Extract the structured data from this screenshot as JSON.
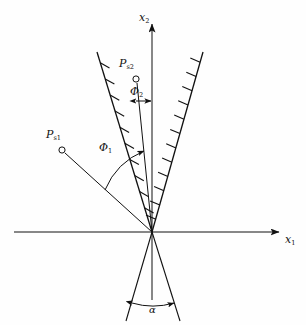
{
  "figure": {
    "type": "technical-line-diagram",
    "background_color": "#fefefe",
    "line_color": "#111111",
    "width": 306,
    "height": 325
  },
  "axes": {
    "x1": {
      "label": "x",
      "subscript": "1",
      "orientation": "horizontal",
      "arrow": "right",
      "start_px": [
        14,
        232
      ],
      "end_px": [
        283,
        232
      ],
      "label_px": [
        286,
        239
      ]
    },
    "x2": {
      "label": "x",
      "subscript": "2",
      "orientation": "vertical",
      "arrow": "up",
      "start_px": [
        152,
        300
      ],
      "end_px": [
        152,
        20
      ],
      "label_px": [
        141,
        18
      ]
    },
    "origin_px": [
      152,
      232
    ]
  },
  "wedge": {
    "name": "hatched-crack-wedge",
    "hatching": "inward-facing tick marks",
    "left_boundary": {
      "from_px": [
        152,
        232
      ],
      "to_px": [
        97,
        52
      ],
      "hatch_side": "right",
      "hatch_count": 10
    },
    "right_boundary": {
      "from_px": [
        152,
        232
      ],
      "to_px": [
        203,
        52
      ],
      "hatch_side": "left",
      "hatch_count": 12
    },
    "lower_left_leg": {
      "from_px": [
        152,
        232
      ],
      "to_px": [
        126,
        321
      ]
    },
    "lower_right_leg": {
      "from_px": [
        152,
        232
      ],
      "to_px": [
        180,
        321
      ]
    }
  },
  "points": [
    {
      "id": "P_s1",
      "label": "P",
      "subscript": "s1",
      "marker": "open-circle",
      "marker_px": [
        62,
        150
      ],
      "label_px": [
        50,
        133
      ],
      "ray_to_origin": true
    },
    {
      "id": "P_s2",
      "label": "P",
      "subscript": "s2",
      "marker": "open-circle",
      "marker_px": [
        136,
        79
      ],
      "label_px": [
        122,
        62
      ],
      "ray_to_origin": true
    }
  ],
  "angles": [
    {
      "id": "phi1",
      "label": "Φ",
      "subscript": "1",
      "label_px": [
        102,
        148
      ],
      "measure": "from P_s1 ray to P_s2 ray",
      "arc": true,
      "arrowhead": "end"
    },
    {
      "id": "phi2",
      "label": "Φ",
      "subscript": "2",
      "label_px": [
        130,
        88
      ],
      "measure": "from P_s2 ray to x2 axis",
      "arc": false,
      "arrowhead": "both"
    },
    {
      "id": "alpha",
      "label": "α",
      "subscript": "",
      "label_px": [
        148,
        306
      ],
      "measure": "wedge opening angle at bottom",
      "arc": true,
      "arrowhead": "both"
    }
  ]
}
